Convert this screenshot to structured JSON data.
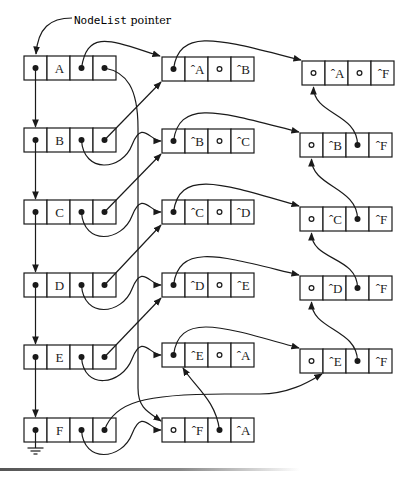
{
  "title": {
    "mono": "NodeList",
    "rest": " pointer"
  },
  "cell_width": 23,
  "cell_height": 24,
  "ink_color": "#1a1a1a",
  "node_list": [
    {
      "id": "A",
      "x": 24,
      "y": 56,
      "label": "A"
    },
    {
      "id": "B",
      "x": 24,
      "y": 128,
      "label": "B"
    },
    {
      "id": "C",
      "x": 24,
      "y": 200,
      "label": "C"
    },
    {
      "id": "D",
      "x": 24,
      "y": 273,
      "label": "D"
    },
    {
      "id": "E",
      "x": 24,
      "y": 345,
      "label": "E"
    },
    {
      "id": "F",
      "x": 24,
      "y": 418,
      "label": "F"
    }
  ],
  "out_arcs": [
    {
      "id": "A",
      "x": 162,
      "y": 57,
      "cells": [
        "•",
        "ˆA",
        "∘",
        "ˆB"
      ]
    },
    {
      "id": "B",
      "x": 162,
      "y": 129,
      "cells": [
        "•",
        "ˆB",
        "∘",
        "ˆC"
      ]
    },
    {
      "id": "C",
      "x": 162,
      "y": 200,
      "cells": [
        "•",
        "ˆC",
        "∘",
        "ˆD"
      ]
    },
    {
      "id": "D",
      "x": 162,
      "y": 273,
      "cells": [
        "•",
        "ˆD",
        "∘",
        "ˆE"
      ]
    },
    {
      "id": "E",
      "x": 162,
      "y": 343,
      "cells": [
        "•",
        "ˆE",
        "∘",
        "ˆA"
      ]
    },
    {
      "id": "F",
      "x": 162,
      "y": 418,
      "cells": [
        "∘",
        "ˆF",
        "•",
        "ˆA"
      ]
    }
  ],
  "in_arcs": [
    {
      "id": "A",
      "x": 302,
      "y": 61,
      "cells": [
        "∘",
        "ˆA",
        "∘",
        "ˆF"
      ]
    },
    {
      "id": "B",
      "x": 300,
      "y": 133,
      "cells": [
        "∘",
        "ˆB",
        "•",
        "ˆF"
      ]
    },
    {
      "id": "C",
      "x": 300,
      "y": 207,
      "cells": [
        "∘",
        "ˆC",
        "•",
        "ˆF"
      ]
    },
    {
      "id": "D",
      "x": 300,
      "y": 276,
      "cells": [
        "∘",
        "ˆD",
        "•",
        "ˆF"
      ]
    },
    {
      "id": "E",
      "x": 300,
      "y": 349,
      "cells": [
        "∘",
        "ˆE",
        "•",
        "ˆF"
      ]
    }
  ],
  "ground_symbol": "null-terminator"
}
